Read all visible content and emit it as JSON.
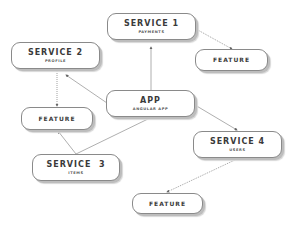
{
  "nodes": {
    "service1": {
      "title": "SERVICE 1",
      "subtitle": "PAYMENTS"
    },
    "service2": {
      "title": "SERVICE 2",
      "subtitle": "PROFILE"
    },
    "service3": {
      "title": "SERVICE  3",
      "subtitle": "ITEMS"
    },
    "service4": {
      "title": "SERVICE 4",
      "subtitle": "USERS"
    },
    "app": {
      "title": "APP",
      "subtitle": "ANGULAR APP"
    },
    "feature_top": {
      "title": "FEATURE"
    },
    "feature_left": {
      "title": "FEATURE"
    },
    "feature_bottom": {
      "title": "FEATURE"
    }
  },
  "edges": [
    {
      "from": "app",
      "to": "service1",
      "style": "solid"
    },
    {
      "from": "app",
      "to": "service2",
      "style": "solid"
    },
    {
      "from": "app",
      "to": "service4",
      "style": "solid"
    },
    {
      "from": "app",
      "to": "service3",
      "style": "solid"
    },
    {
      "from": "service1",
      "to": "feature_top",
      "style": "dotted"
    },
    {
      "from": "service2",
      "to": "feature_left",
      "style": "dotted"
    },
    {
      "from": "service3",
      "to": "feature_left",
      "style": "solid"
    },
    {
      "from": "service4",
      "to": "feature_bottom",
      "style": "dotted"
    }
  ],
  "colors": {
    "line": "#8a8a8a",
    "text": "#3a3a3a",
    "shadow": "#bdbdbd"
  }
}
